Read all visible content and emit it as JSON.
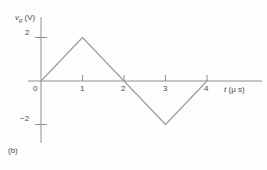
{
  "figure": {
    "caption": "(b)",
    "background_color": "#fdfdfd",
    "line_color": "#9a9a9a",
    "axis_color": "#8f8f8f",
    "text_color": "#4a4a4a"
  },
  "axes": {
    "y_title_symbol": "v",
    "y_title_subscript": "g",
    "y_title_unit": "(V)",
    "y_title_full": "v_g (V)",
    "x_title_symbol": "t",
    "x_title_unit": "(μ s)",
    "x_title_full": "t (μ s)",
    "x_ticks": [
      "0",
      "1",
      "2",
      "3",
      "4"
    ],
    "y_ticks": [
      "2",
      "−2"
    ]
  },
  "chart_data": {
    "type": "line",
    "title": "",
    "subtitle": "",
    "xlabel": "t (μ s)",
    "ylabel": "v_g (V)",
    "xlim": [
      0,
      4.6
    ],
    "ylim": [
      -3,
      2.6
    ],
    "grid": false,
    "legend": null,
    "x_tick_values": [
      0,
      1,
      2,
      3,
      4
    ],
    "y_tick_values": [
      2,
      -2
    ],
    "series": [
      {
        "name": "v_g(t)",
        "color": "#9a9a9a",
        "x": [
          0,
          1,
          2,
          3,
          4
        ],
        "y": [
          0,
          2,
          0,
          -2,
          0
        ]
      }
    ],
    "annotations": [
      "(b)"
    ]
  }
}
